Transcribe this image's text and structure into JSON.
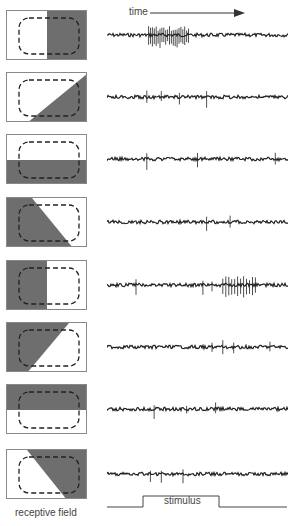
{
  "labels": {
    "time": "time",
    "receptive_field": "receptive field",
    "stimulus": "stimulus"
  },
  "colors": {
    "shade": "#6e6e6e",
    "trace": "#222222",
    "border": "#888888"
  },
  "rows": [
    {
      "stimulus": "right-half-dark",
      "response": "strong burst during stimulus"
    },
    {
      "stimulus": "diagonal-lower-right-dark",
      "response": "weak"
    },
    {
      "stimulus": "bottom-half-dark",
      "response": "none"
    },
    {
      "stimulus": "diagonal-lower-left-dark",
      "response": "weak"
    },
    {
      "stimulus": "left-half-dark",
      "response": "burst after stimulus (off response)"
    },
    {
      "stimulus": "diagonal-upper-left-dark",
      "response": "weak"
    },
    {
      "stimulus": "top-half-dark",
      "response": "none"
    },
    {
      "stimulus": "diagonal-upper-right-dark",
      "response": "weak"
    }
  ]
}
